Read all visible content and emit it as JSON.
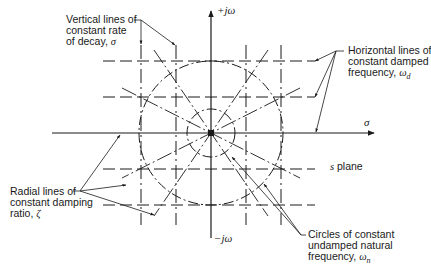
{
  "diagram": {
    "title": "s plane",
    "axes": {
      "horizontal_label": "σ",
      "vertical_positive_label": "+jω",
      "vertical_negative_label": "−jω"
    },
    "plane_label": "s plane",
    "annotations": {
      "vertical_lines": {
        "line1": "Vertical lines of",
        "line2": "constant rate",
        "line3_prefix": "of decay, ",
        "symbol": "σ"
      },
      "horizontal_lines": {
        "line1": "Horizontal lines of",
        "line2": "constant damped",
        "line3_prefix": "frequency, ",
        "symbol": "ω",
        "subscript": "d"
      },
      "radial_lines": {
        "line1": "Radial lines of",
        "line2": "constant damping",
        "line3_prefix": "ratio, ",
        "symbol": "ζ"
      },
      "circles": {
        "line1": "Circles of constant",
        "line2": "undamped natural",
        "line3_prefix": "frequency, ",
        "symbol": "ω",
        "subscript": "n"
      }
    },
    "colors": {
      "ink": "#1a1a1a",
      "background": "#ffffff"
    }
  }
}
